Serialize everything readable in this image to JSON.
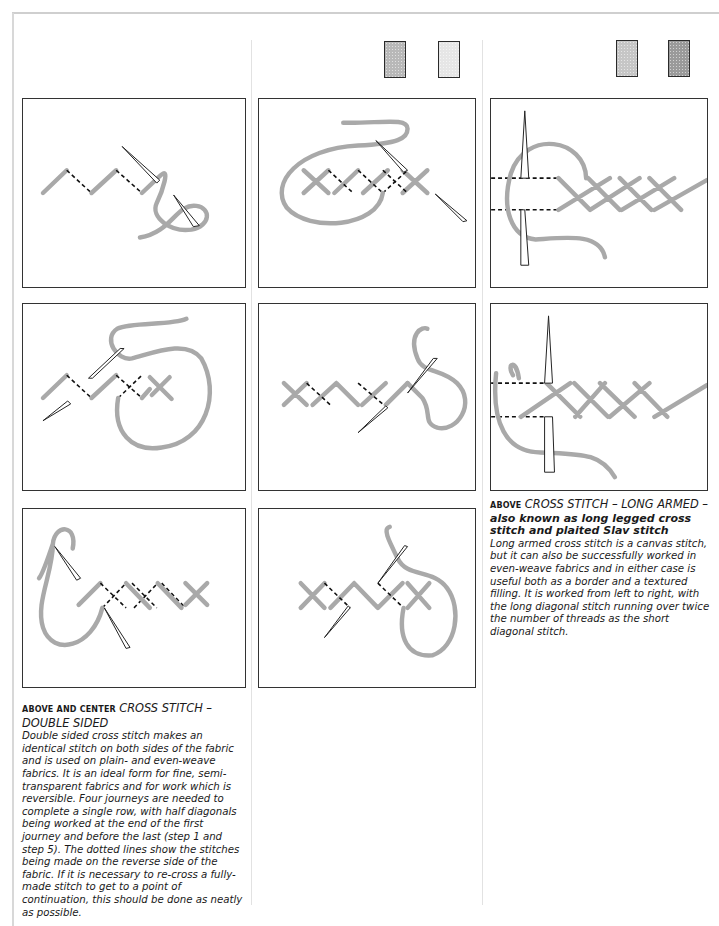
{
  "page": {
    "swatches": {
      "center": [
        {
          "name": "medium-gray-fabric",
          "color": "#b8b8b8"
        },
        {
          "name": "light-gray-fabric",
          "color": "#e6e6e6"
        }
      ],
      "right": [
        {
          "name": "light-gray-fabric",
          "color": "#c6c6c6"
        },
        {
          "name": "dark-gray-fabric",
          "color": "#9a9a9a"
        }
      ]
    },
    "colors": {
      "thread": "#a9a9a9",
      "border": "#333333",
      "dotted": "#111111"
    }
  },
  "double_sided": {
    "lead": "Above and center",
    "title": "CROSS STITCH – DOUBLE SIDED",
    "body": "Double sided cross stitch makes an identical stitch on both sides of the fabric and is used on plain- and even-weave fabrics. It is an ideal form for fine, semi-transparent fabrics and for work which is reversible. Four journeys are needed to complete a single row, with half diagonals being worked at the end of the first journey and before the last (step 1 and step 5). The dotted lines show the stitches being made on the reverse side of the fabric. If it is necessary to re-cross a fully-made stitch to get to a point of continuation, this should be done as neatly as possible.",
    "steps": [
      "step-1",
      "step-2",
      "step-3",
      "step-4",
      "step-5",
      "step-6"
    ]
  },
  "long_armed": {
    "lead": "Above",
    "title": "CROSS STITCH – LONG ARMED –",
    "subtitle": "also known as long legged cross stitch and plaited Slav stitch",
    "body": "Long armed cross stitch is a canvas stitch, but it can also be successfully worked in even-weave fabrics and in either case is useful both as a border and a textured filling. It is worked from left to right, with the long diagonal stitch running over twice the number of threads as the short diagonal stitch.",
    "steps": [
      "step-1",
      "step-2"
    ]
  }
}
